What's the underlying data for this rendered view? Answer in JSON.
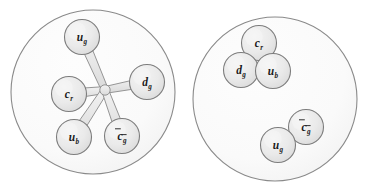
{
  "figure": {
    "background_color": "#ffffff",
    "bag_fill": "#fbfbfb",
    "bag_stroke": "#8a8a8a",
    "node_fill": "#ebebeb",
    "node_stroke": "#7d7d7d",
    "string_fill": "#ededed",
    "string_stroke": "#8a8a8a",
    "label_color": "#1a1a1a"
  },
  "panels": [
    {
      "name": "left-panel",
      "id": "panel-left",
      "caption": "",
      "bag": {
        "cx": 93,
        "cy": 92,
        "r": 82
      },
      "hub": {
        "x": 105,
        "y": 90
      },
      "nodes": [
        {
          "id": "left-node-ug",
          "cx": 82,
          "cy": 37,
          "r": 17.5,
          "glyph": "u",
          "sub": "g",
          "bar": false,
          "sub_bar": false,
          "label": "u_g"
        },
        {
          "id": "left-node-dg",
          "cx": 147,
          "cy": 82,
          "r": 17.5,
          "glyph": "d",
          "sub": "g",
          "bar": false,
          "sub_bar": false,
          "label": "d_g"
        },
        {
          "id": "left-node-cr",
          "cx": 69,
          "cy": 94,
          "r": 17.5,
          "glyph": "c",
          "sub": "r",
          "bar": false,
          "sub_bar": false,
          "label": "c_r"
        },
        {
          "id": "left-node-ub",
          "cx": 74,
          "cy": 137,
          "r": 17.5,
          "glyph": "u",
          "sub": "b",
          "bar": false,
          "sub_bar": false,
          "label": "u_b"
        },
        {
          "id": "left-node-cbar",
          "cx": 122,
          "cy": 136,
          "r": 17.5,
          "glyph": "c",
          "sub": "g",
          "bar": true,
          "sub_bar": true,
          "label": "cbar_gbar"
        }
      ],
      "strings": [
        {
          "id": "string-hub-ug",
          "from": "left-node-ug",
          "to": "hub"
        },
        {
          "id": "string-hub-dg",
          "from": "left-node-dg",
          "to": "hub"
        },
        {
          "id": "string-hub-cr",
          "from": "left-node-cr",
          "to": "hub"
        },
        {
          "id": "string-hub-ub",
          "from": "left-node-ub",
          "to": "hub"
        },
        {
          "id": "string-hub-cbar",
          "from": "left-node-cbar",
          "to": "hub"
        }
      ]
    },
    {
      "name": "right-panel",
      "id": "panel-right",
      "caption": "",
      "bag": {
        "cx": 275,
        "cy": 99,
        "r": 82
      },
      "hub": null,
      "nodes": [
        {
          "id": "right-node-cr",
          "cx": 259,
          "cy": 43,
          "r": 17.5,
          "glyph": "c",
          "sub": "r",
          "bar": false,
          "sub_bar": false,
          "label": "c_r"
        },
        {
          "id": "right-node-dg",
          "cx": 241,
          "cy": 70,
          "r": 17.5,
          "glyph": "d",
          "sub": "g",
          "bar": false,
          "sub_bar": false,
          "label": "d_g"
        },
        {
          "id": "right-node-ub",
          "cx": 273,
          "cy": 71,
          "r": 17.5,
          "glyph": "u",
          "sub": "b",
          "bar": false,
          "sub_bar": false,
          "label": "u_b"
        },
        {
          "id": "right-node-cbar",
          "cx": 306,
          "cy": 127,
          "r": 17.5,
          "glyph": "c",
          "sub": "g",
          "bar": true,
          "sub_bar": true,
          "label": "cbar_gbar"
        },
        {
          "id": "right-node-ug",
          "cx": 278,
          "cy": 145,
          "r": 17.5,
          "glyph": "u",
          "sub": "g",
          "bar": false,
          "sub_bar": false,
          "label": "u_g"
        }
      ],
      "strings": []
    }
  ]
}
